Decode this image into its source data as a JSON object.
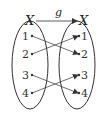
{
  "diagram": {
    "function_name": "g",
    "domain_set": {
      "name": "X",
      "elements": [
        "1",
        "2",
        "3",
        "4"
      ]
    },
    "codomain_set": {
      "name": "X",
      "elements": [
        "1",
        "2",
        "3",
        "4"
      ]
    },
    "mapping": [
      {
        "from": "1",
        "to": "2"
      },
      {
        "from": "2",
        "to": "1"
      },
      {
        "from": "3",
        "to": "4"
      },
      {
        "from": "4",
        "to": "3"
      }
    ],
    "colors": {
      "stroke": "#333333",
      "background": "#ffffff"
    }
  }
}
